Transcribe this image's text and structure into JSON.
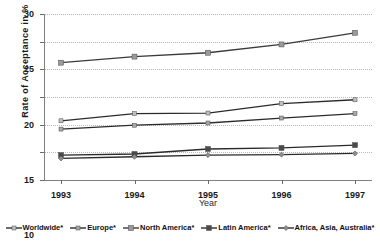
{
  "chart_data": {
    "type": "line",
    "title": "",
    "xlabel": "Year",
    "ylabel": "Rate of Acceptance in %",
    "categories": [
      "1993",
      "1994",
      "1995",
      "1996",
      "1997"
    ],
    "x": [
      1993,
      1994,
      1995,
      1996,
      1997
    ],
    "ylim": [
      0,
      30
    ],
    "yticks": [
      0,
      5,
      10,
      15,
      20,
      25,
      30
    ],
    "grid": true,
    "legend_position": "bottom",
    "series": [
      {
        "name": "Worldwide*",
        "values": [
          10.7,
          12.0,
          12.1,
          13.8,
          14.5
        ],
        "color": "#bfbfbf",
        "line_color": "#2b2b2b",
        "marker": "small-square"
      },
      {
        "name": "Europe*",
        "values": [
          9.2,
          9.9,
          10.3,
          11.2,
          12.0
        ],
        "color": "#a8a8a8",
        "line_color": "#2b2b2b",
        "marker": "small-square"
      },
      {
        "name": "North America*",
        "values": [
          21.2,
          22.3,
          23.0,
          24.5,
          26.6
        ],
        "color": "#9a9a9a",
        "line_color": "#3a3a3a",
        "marker": "square"
      },
      {
        "name": "Latin America*",
        "values": [
          4.5,
          4.7,
          5.6,
          5.8,
          6.3
        ],
        "color": "#4a4a4a",
        "line_color": "#2b2b2b",
        "marker": "square"
      },
      {
        "name": "Africa, Asia, Australia*",
        "values": [
          3.9,
          4.2,
          4.5,
          4.6,
          4.8
        ],
        "color": "#8e8e8e",
        "line_color": "#2b2b2b",
        "marker": "diamond"
      }
    ]
  },
  "axis": {
    "ylabel": "Rate of Acceptance in %",
    "xlabel": "Year",
    "ytick_labels": [
      "30",
      "25",
      "20",
      "15",
      "10",
      "5",
      "0"
    ],
    "xtick_labels": [
      "1993",
      "1994",
      "1995",
      "1996",
      "1997"
    ]
  },
  "legend": {
    "items": [
      {
        "label": "Worldwide*"
      },
      {
        "label": "Europe*"
      },
      {
        "label": "North America*"
      },
      {
        "label": "Latin America*"
      },
      {
        "label": "Africa, Asia, Australia*"
      }
    ]
  }
}
